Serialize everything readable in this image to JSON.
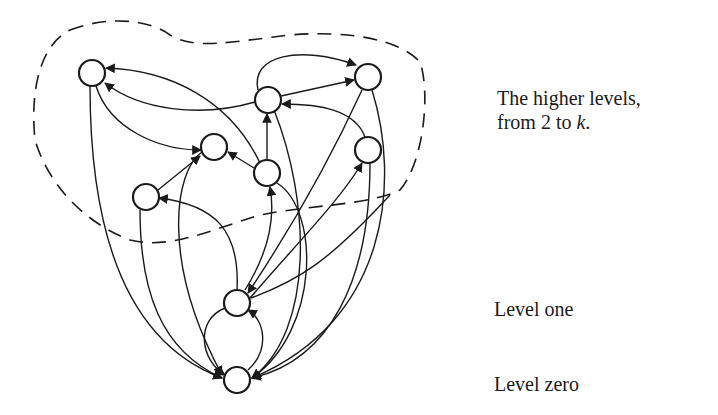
{
  "labels": {
    "higher_line1": "The higher levels,",
    "higher_line2_prefix": "from 2 to ",
    "higher_line2_var": "k",
    "higher_line2_suffix": ".",
    "level_one": "Level one",
    "level_zero": "Level zero"
  },
  "colors": {
    "ink": "#1a1a1a",
    "background": "#ffffff"
  },
  "nodes": [
    {
      "id": "A",
      "x": 92,
      "y": 73
    },
    {
      "id": "B",
      "x": 368,
      "y": 77
    },
    {
      "id": "C",
      "x": 268,
      "y": 100
    },
    {
      "id": "D",
      "x": 214,
      "y": 147
    },
    {
      "id": "E",
      "x": 368,
      "y": 150
    },
    {
      "id": "F",
      "x": 267,
      "y": 173
    },
    {
      "id": "G",
      "x": 146,
      "y": 197
    },
    {
      "id": "H",
      "x": 237,
      "y": 303,
      "level": "one"
    },
    {
      "id": "I",
      "x": 237,
      "y": 380,
      "level": "zero"
    }
  ]
}
